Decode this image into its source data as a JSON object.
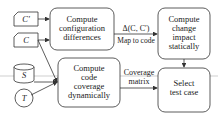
{
  "diagram": {
    "inputs": {
      "c_prime": "C′",
      "c": "C",
      "s": "S",
      "t": "T"
    },
    "nodes": {
      "config_diff": [
        "Compute",
        "configuration",
        "differences"
      ],
      "change_impact": [
        "Compute",
        "change",
        "impact",
        "statically"
      ],
      "code_coverage": [
        "Compute",
        "code",
        "coverage",
        "dynamically"
      ],
      "select_test": [
        "Select",
        "test case"
      ]
    },
    "edge_labels": {
      "delta": "Δ(C, C′)",
      "map_to_code": "Map to code",
      "coverage_matrix": [
        "Coverage",
        "matrix"
      ]
    },
    "colors": {
      "stroke": "#333333",
      "background": "#ffffff",
      "divider": "#cfcfcf"
    }
  }
}
